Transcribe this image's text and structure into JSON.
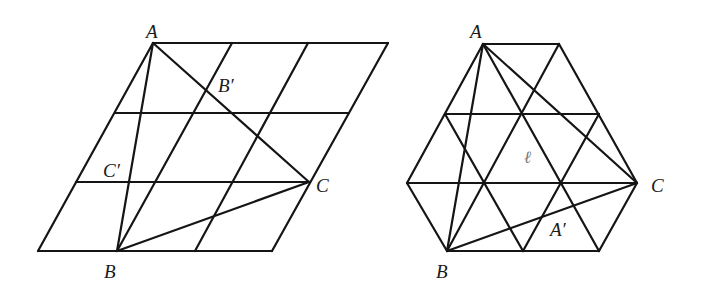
{
  "figures": [
    {
      "id": "parallelogram-figure",
      "description": "Parallelogram grid (3x3) with triangle ABC",
      "grid_segments": [
        [
          153,
          43,
          388,
          43
        ],
        [
          115,
          113,
          349,
          113
        ],
        [
          76,
          182,
          310,
          182
        ],
        [
          38,
          251,
          272,
          251
        ],
        [
          38,
          251,
          153,
          43
        ],
        [
          117,
          251,
          232,
          43
        ],
        [
          195,
          251,
          308,
          43
        ],
        [
          272,
          251,
          388,
          43
        ]
      ],
      "triangle_segments": [
        [
          153,
          43,
          117,
          251
        ],
        [
          153,
          43,
          309,
          182
        ],
        [
          117,
          251,
          309,
          182
        ]
      ],
      "labels": [
        {
          "text": "A",
          "x": 146,
          "y": 38,
          "style": "normal"
        },
        {
          "text": "B′",
          "x": 218,
          "y": 92,
          "style": "normal"
        },
        {
          "text": "C′",
          "x": 103,
          "y": 177,
          "style": "normal"
        },
        {
          "text": "C",
          "x": 316,
          "y": 192,
          "style": "normal"
        },
        {
          "text": "B",
          "x": 104,
          "y": 278,
          "style": "normal"
        }
      ]
    },
    {
      "id": "hexagon-figure",
      "description": "Hexagon with triangular grid and triangle ABC",
      "grid_segments": [
        [
          483,
          44,
          559,
          44
        ],
        [
          445,
          114,
          599,
          114
        ],
        [
          407,
          183,
          637,
          183
        ],
        [
          447,
          251,
          599,
          251
        ],
        [
          483,
          44,
          407,
          183
        ],
        [
          407,
          183,
          447,
          251
        ],
        [
          559,
          44,
          637,
          183
        ],
        [
          637,
          183,
          599,
          251
        ],
        [
          483,
          44,
          599,
          251
        ],
        [
          445,
          114,
          523,
          251
        ],
        [
          559,
          44,
          447,
          251
        ],
        [
          599,
          114,
          523,
          251
        ]
      ],
      "triangle_segments": [
        [
          483,
          44,
          447,
          251
        ],
        [
          483,
          44,
          637,
          183
        ],
        [
          447,
          251,
          637,
          183
        ]
      ],
      "labels": [
        {
          "text": "A",
          "x": 470,
          "y": 38,
          "style": "normal"
        },
        {
          "text": "ℓ",
          "x": 524,
          "y": 163,
          "style": "grey"
        },
        {
          "text": "C",
          "x": 651,
          "y": 192,
          "style": "normal"
        },
        {
          "text": "A′",
          "x": 550,
          "y": 236,
          "style": "normal"
        },
        {
          "text": "B",
          "x": 436,
          "y": 278,
          "style": "normal"
        }
      ]
    }
  ],
  "colors": {
    "line": "#151515",
    "label": "#1a1a1a",
    "label_muted": "#777777",
    "background": "#ffffff"
  }
}
